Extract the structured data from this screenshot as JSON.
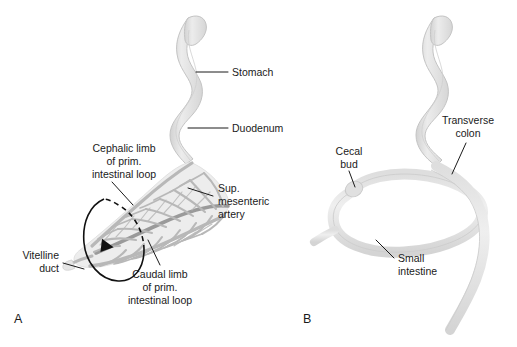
{
  "figure": {
    "panels": [
      {
        "id": "A",
        "letter": "A",
        "labels": [
          {
            "name": "stomach",
            "lines": [
              "Stomach"
            ],
            "align": "left"
          },
          {
            "name": "duodenum",
            "lines": [
              "Duodenum"
            ],
            "align": "left"
          },
          {
            "name": "cephalic-limb",
            "lines": [
              "Cephalic limb",
              "of prim.",
              "intestinal loop"
            ],
            "align": "center"
          },
          {
            "name": "caudal-limb",
            "lines": [
              "Caudal limb",
              "of prim.",
              "intestinal loop"
            ],
            "align": "center"
          },
          {
            "name": "sup-mesenteric-artery",
            "lines": [
              "Sup.",
              "mesenteric",
              "artery"
            ],
            "align": "left"
          },
          {
            "name": "vitelline-duct",
            "lines": [
              "Vitelline",
              "duct"
            ],
            "align": "right"
          }
        ]
      },
      {
        "id": "B",
        "letter": "B",
        "labels": [
          {
            "name": "cecal-bud",
            "lines": [
              "Cecal",
              "bud"
            ],
            "align": "center"
          },
          {
            "name": "transverse-colon",
            "lines": [
              "Transverse",
              "colon"
            ],
            "align": "center"
          },
          {
            "name": "small-intestine",
            "lines": [
              "Small",
              "intestine"
            ],
            "align": "left"
          }
        ]
      }
    ],
    "colors": {
      "background": "#ffffff",
      "organ_fill": "#e3e3e3",
      "organ_edge": "#c4c4c4",
      "vessel": "#b8b8b8",
      "vessel_dark": "#9a9a9a",
      "label_text": "#1a1a1a",
      "leader_line": "#1a1a1a",
      "rotation_arrow": "#111111"
    }
  }
}
